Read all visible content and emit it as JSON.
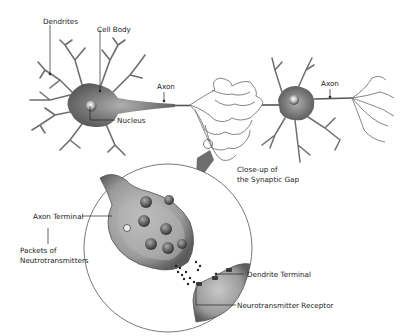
{
  "diagram": {
    "labels": {
      "dendrites": "Dendrites",
      "cell_body": "Cell Body",
      "nucleus": "Nucleus",
      "axon_left": "Axon",
      "axon_right": "Axon",
      "closeup_line1": "Close-up of",
      "closeup_line2": "the Synaptic Gap",
      "axon_terminal": "Axon Terminal",
      "packets_line1": "Packets of",
      "packets_line2": "Neutrotransmitters",
      "dendrite_terminal": "Dendrite Terminal",
      "receptor": "Neurotransmitter Receptor"
    },
    "colors": {
      "cell": "#8a8a8a",
      "cell_dark": "#555555",
      "line": "#333333",
      "background": "#ffffff"
    }
  }
}
